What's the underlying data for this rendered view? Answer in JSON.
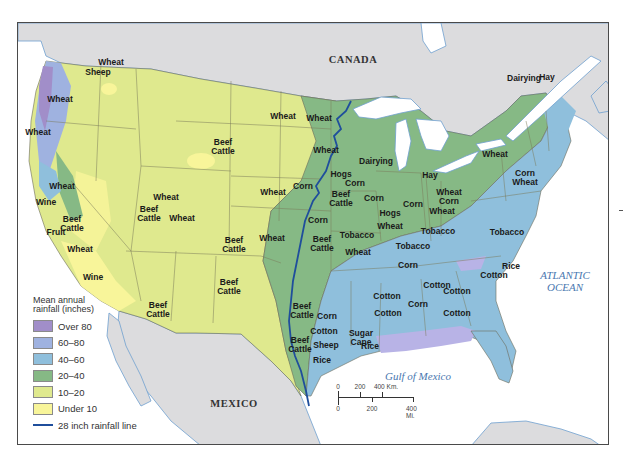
{
  "map": {
    "title": "Agricultural regions and mean annual rainfall of the United States",
    "colors": {
      "over_80": "#a18ec9",
      "r60_80": "#9fb2e0",
      "r40_60": "#8fbfdc",
      "r20_40": "#86b985",
      "r10_20": "#dfe98e",
      "under_10": "#f8f59a",
      "foreign_land": "#dcdcde",
      "water": "#ffffff",
      "rainfall_line": "#1f4e9c",
      "border": "#6b6b5a"
    },
    "place_labels": [
      {
        "id": "canada",
        "text": "CANADA",
        "x": 353,
        "y": 59
      },
      {
        "id": "mexico",
        "text": "MEXICO",
        "x": 234,
        "y": 403
      }
    ],
    "water_labels": [
      {
        "id": "atlantic",
        "text": "ATLANTIC\nOCEAN",
        "x": 565,
        "y": 281
      },
      {
        "id": "gulf",
        "text": "Gulf of Mexico",
        "x": 418,
        "y": 376
      }
    ],
    "crop_labels": [
      {
        "text": "Wheat",
        "x": 60,
        "y": 99
      },
      {
        "text": "Wheat",
        "x": 111,
        "y": 62
      },
      {
        "text": "Sheep",
        "x": 98,
        "y": 72
      },
      {
        "text": "Wheat",
        "x": 38,
        "y": 132
      },
      {
        "text": "Wheat",
        "x": 62,
        "y": 186
      },
      {
        "text": "Wine",
        "x": 46,
        "y": 202
      },
      {
        "text": "Beef\nCattle",
        "x": 72,
        "y": 224
      },
      {
        "text": "Fruit",
        "x": 56,
        "y": 232
      },
      {
        "text": "Wheat",
        "x": 80,
        "y": 249
      },
      {
        "text": "Wine",
        "x": 93,
        "y": 277
      },
      {
        "text": "Wheat",
        "x": 166,
        "y": 197
      },
      {
        "text": "Beef\nCattle",
        "x": 149,
        "y": 214
      },
      {
        "text": "Beef\nCattle",
        "x": 223,
        "y": 147
      },
      {
        "text": "Wheat",
        "x": 182,
        "y": 218
      },
      {
        "text": "Beef\nCattle",
        "x": 234,
        "y": 245
      },
      {
        "text": "Beef\nCattle",
        "x": 229,
        "y": 287
      },
      {
        "text": "Beef\nCattle",
        "x": 158,
        "y": 310
      },
      {
        "text": "Wheat",
        "x": 283,
        "y": 116
      },
      {
        "text": "Wheat",
        "x": 319,
        "y": 118
      },
      {
        "text": "Wheat",
        "x": 326,
        "y": 150
      },
      {
        "text": "Wheat",
        "x": 273,
        "y": 192
      },
      {
        "text": "Corn",
        "x": 303,
        "y": 186
      },
      {
        "text": "Wheat",
        "x": 272,
        "y": 238
      },
      {
        "text": "Dairying",
        "x": 376,
        "y": 161
      },
      {
        "text": "Hogs",
        "x": 341,
        "y": 174
      },
      {
        "text": "Corn",
        "x": 355,
        "y": 183
      },
      {
        "text": "Beef\nCattle",
        "x": 341,
        "y": 199
      },
      {
        "text": "Corn",
        "x": 374,
        "y": 198
      },
      {
        "text": "Corn",
        "x": 318,
        "y": 220
      },
      {
        "text": "Beef\nCattle",
        "x": 322,
        "y": 244
      },
      {
        "text": "Tobacco",
        "x": 357,
        "y": 235
      },
      {
        "text": "Wheat",
        "x": 358,
        "y": 252
      },
      {
        "text": "Hogs",
        "x": 390,
        "y": 213
      },
      {
        "text": "Wheat",
        "x": 390,
        "y": 226
      },
      {
        "text": "Hay",
        "x": 430,
        "y": 175
      },
      {
        "text": "Corn",
        "x": 413,
        "y": 204
      },
      {
        "text": "Wheat\nCorn",
        "x": 449,
        "y": 197
      },
      {
        "text": "Wheat",
        "x": 442,
        "y": 211
      },
      {
        "text": "Tobacco",
        "x": 438,
        "y": 231
      },
      {
        "text": "Tobacco",
        "x": 413,
        "y": 246
      },
      {
        "text": "Tobacco",
        "x": 507,
        "y": 232
      },
      {
        "text": "Dairying",
        "x": 524,
        "y": 78
      },
      {
        "text": "Hay",
        "x": 547,
        "y": 77
      },
      {
        "text": "Wheat",
        "x": 495,
        "y": 154
      },
      {
        "text": "Corn\nWheat",
        "x": 525,
        "y": 178
      },
      {
        "text": "Corn",
        "x": 408,
        "y": 265
      },
      {
        "text": "Rice",
        "x": 511,
        "y": 266
      },
      {
        "text": "Cotton",
        "x": 437,
        "y": 285
      },
      {
        "text": "Cotton",
        "x": 494,
        "y": 275
      },
      {
        "text": "Cotton",
        "x": 387,
        "y": 296
      },
      {
        "text": "Cotton",
        "x": 457,
        "y": 291
      },
      {
        "text": "Corn",
        "x": 418,
        "y": 304
      },
      {
        "text": "Cotton",
        "x": 388,
        "y": 313
      },
      {
        "text": "Cotton",
        "x": 457,
        "y": 313
      },
      {
        "text": "Beef\nCattle",
        "x": 302,
        "y": 311
      },
      {
        "text": "Corn",
        "x": 327,
        "y": 316
      },
      {
        "text": "Cotton",
        "x": 324,
        "y": 331
      },
      {
        "text": "Sugar\nCane",
        "x": 361,
        "y": 338
      },
      {
        "text": "Beef\nCattle",
        "x": 300,
        "y": 345
      },
      {
        "text": "Sheep",
        "x": 326,
        "y": 345
      },
      {
        "text": "Rice",
        "x": 370,
        "y": 346
      },
      {
        "text": "Rice",
        "x": 322,
        "y": 360
      }
    ],
    "legend": {
      "title_line1": "Mean annual",
      "title_line2": "rainfall (inches)",
      "items": [
        {
          "label": "Over 80",
          "color": "#a18ec9"
        },
        {
          "label": "60–80",
          "color": "#9fb2e0"
        },
        {
          "label": "40–60",
          "color": "#8fbfdc"
        },
        {
          "label": "20–40",
          "color": "#86b985"
        },
        {
          "label": "10–20",
          "color": "#dfe98e"
        },
        {
          "label": "Under 10",
          "color": "#f8f59a"
        }
      ],
      "line_label": "28 inch rainfall line"
    },
    "scale": {
      "km_ticks": [
        "0",
        "200",
        "400 Km."
      ],
      "mi_ticks": [
        "0",
        "200",
        "400 Mi."
      ]
    }
  }
}
